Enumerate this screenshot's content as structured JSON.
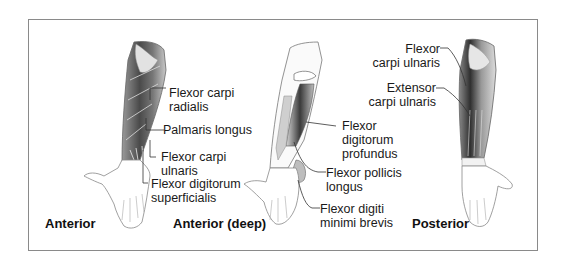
{
  "figure": {
    "views": [
      {
        "title": "Anterior",
        "labels": [
          {
            "line1": "Flexor carpi",
            "line2": "radialis"
          },
          {
            "line1": "Palmaris longus"
          },
          {
            "line1": "Flexor carpi",
            "line2": "ulnaris"
          },
          {
            "line1": "Flexor digitorum",
            "line2": "superficialis"
          }
        ]
      },
      {
        "title": "Anterior (deep)",
        "labels": [
          {
            "line1": "Flexor",
            "line2": "digitorum",
            "line3": "profundus"
          },
          {
            "line1": "Flexor pollicis",
            "line2": "longus"
          },
          {
            "line1": "Flexor digiti",
            "line2": "minimi brevis"
          }
        ]
      },
      {
        "title": "Posterior",
        "labels": [
          {
            "line1": "Flexor",
            "line2": "carpi ulnaris"
          },
          {
            "line1": "Extensor",
            "line2": "carpi ulnaris"
          }
        ]
      }
    ]
  },
  "colors": {
    "frame": "#8a8a8a",
    "muscle_dark": "#3a3a3a",
    "muscle_mid": "#8c8c8c",
    "outline": "#555555"
  }
}
